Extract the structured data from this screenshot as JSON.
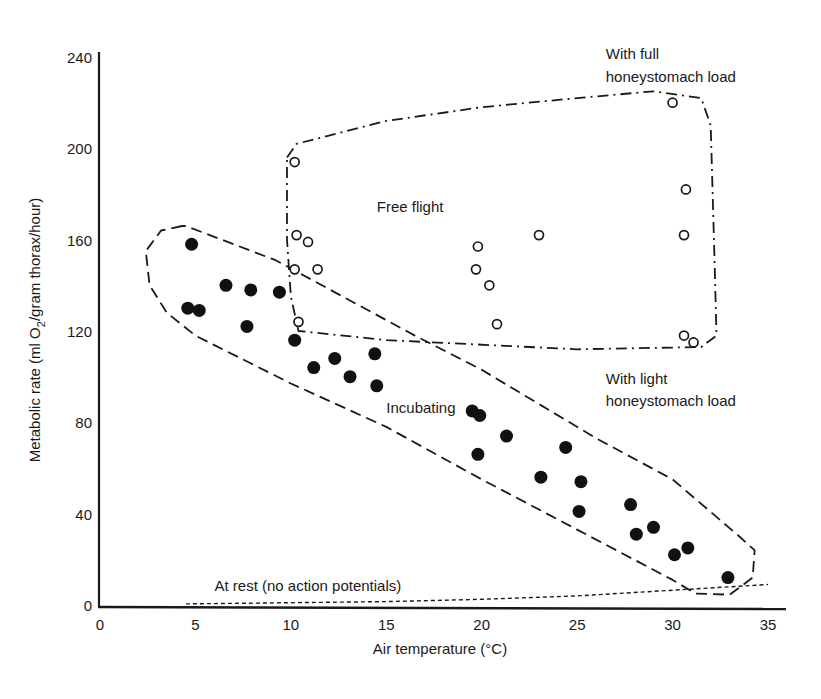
{
  "chart_data": {
    "type": "scatter",
    "title": "",
    "xlabel": "Air temperature (°C)",
    "ylabel": "Metabolic rate (ml O2/gram thorax/hour)",
    "ylabel_parts": {
      "pre": "Metabolic rate (ml O",
      "sub": "2",
      "post": "/gram thorax/hour)"
    },
    "xlim": [
      0,
      36
    ],
    "ylim": [
      0,
      240
    ],
    "x_ticks": [
      0,
      5,
      10,
      15,
      20,
      25,
      30,
      35
    ],
    "y_ticks": [
      0,
      40,
      80,
      120,
      160,
      200,
      240
    ],
    "grid": false,
    "legend": null,
    "series": [
      {
        "name": "Free flight",
        "marker": "open-circle",
        "points": [
          [
            10.2,
            194
          ],
          [
            10.3,
            162
          ],
          [
            10.9,
            159
          ],
          [
            10.2,
            147
          ],
          [
            11.4,
            147
          ],
          [
            10.4,
            124
          ],
          [
            19.8,
            157
          ],
          [
            19.7,
            147
          ],
          [
            20.4,
            140
          ],
          [
            20.8,
            123
          ],
          [
            23.0,
            162
          ],
          [
            30.0,
            220
          ],
          [
            30.7,
            182
          ],
          [
            30.6,
            162
          ],
          [
            30.6,
            118
          ],
          [
            31.1,
            115
          ]
        ]
      },
      {
        "name": "Incubating",
        "marker": "filled-circle",
        "points": [
          [
            4.8,
            158
          ],
          [
            4.6,
            130
          ],
          [
            5.2,
            129
          ],
          [
            6.6,
            140
          ],
          [
            7.9,
            138
          ],
          [
            7.7,
            122
          ],
          [
            9.4,
            137
          ],
          [
            10.2,
            116
          ],
          [
            11.2,
            104
          ],
          [
            12.3,
            108
          ],
          [
            13.1,
            100
          ],
          [
            14.4,
            110
          ],
          [
            14.5,
            96
          ],
          [
            19.5,
            85
          ],
          [
            19.9,
            83
          ],
          [
            19.8,
            66
          ],
          [
            21.3,
            74
          ],
          [
            23.1,
            56
          ],
          [
            24.4,
            69
          ],
          [
            25.2,
            54
          ],
          [
            25.1,
            41
          ],
          [
            27.8,
            44
          ],
          [
            28.1,
            31
          ],
          [
            29.0,
            34
          ],
          [
            30.1,
            22
          ],
          [
            30.8,
            25
          ],
          [
            32.9,
            12
          ]
        ]
      },
      {
        "name": "At rest (no action potentials)",
        "marker": "dashed-line",
        "points": [
          [
            4.5,
            0.5
          ],
          [
            10,
            1
          ],
          [
            15,
            1.5
          ],
          [
            20,
            2.5
          ],
          [
            25,
            4
          ],
          [
            30,
            6.5
          ],
          [
            35,
            9
          ]
        ]
      }
    ],
    "regions": [
      {
        "name": "Free flight envelope",
        "style": "dash-dot",
        "outline": [
          [
            9.8,
            196
          ],
          [
            10.3,
            202
          ],
          [
            15,
            212
          ],
          [
            20,
            218
          ],
          [
            25,
            222
          ],
          [
            29,
            225
          ],
          [
            31.5,
            222
          ],
          [
            32,
            210
          ],
          [
            32.2,
            150
          ],
          [
            32.3,
            118
          ],
          [
            31.5,
            113
          ],
          [
            25,
            112
          ],
          [
            15,
            116
          ],
          [
            10.4,
            120
          ],
          [
            10,
            135
          ],
          [
            9.8,
            160
          ],
          [
            9.8,
            190
          ]
        ]
      },
      {
        "name": "Incubating envelope",
        "style": "dashed",
        "outline": [
          [
            4.3,
            166
          ],
          [
            3.2,
            164
          ],
          [
            2.4,
            155
          ],
          [
            2.6,
            140
          ],
          [
            3.5,
            128
          ],
          [
            5.0,
            118
          ],
          [
            10,
            97
          ],
          [
            15,
            78
          ],
          [
            20,
            55
          ],
          [
            25,
            33
          ],
          [
            30,
            11
          ],
          [
            31.2,
            5
          ],
          [
            33,
            4.5
          ],
          [
            34.2,
            12
          ],
          [
            34.3,
            24
          ],
          [
            33.5,
            30
          ],
          [
            30,
            55
          ],
          [
            26,
            73
          ],
          [
            20,
            103
          ],
          [
            16.5,
            118
          ],
          [
            9.2,
            151
          ],
          [
            4.5,
            166
          ]
        ]
      }
    ],
    "annotations": [
      {
        "text": "Free flight",
        "x": 14.5,
        "y": 172
      },
      {
        "text": "Incubating",
        "x": 15.0,
        "y": 84
      },
      {
        "text": "At rest (no action potentials)",
        "x": 6.0,
        "y": 6
      },
      {
        "text": "With full",
        "x": 26.5,
        "y": 239,
        "anchor": "start"
      },
      {
        "text": "honeystomach load",
        "x": 26.5,
        "y": 229,
        "anchor": "start"
      },
      {
        "text": "With light",
        "x": 26.5,
        "y": 97,
        "anchor": "start"
      },
      {
        "text": "honeystomach load",
        "x": 26.5,
        "y": 87,
        "anchor": "start"
      }
    ]
  }
}
